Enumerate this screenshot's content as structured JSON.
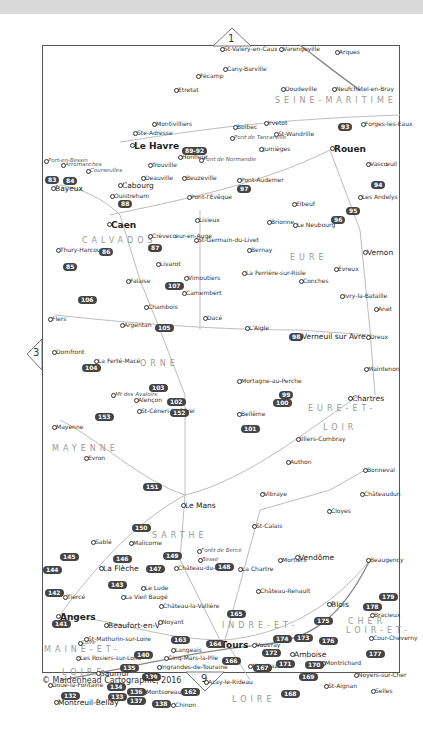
{
  "map": {
    "copyright": "© Maidenhead Cartographic, 2016",
    "page_markers": {
      "top": "1",
      "left": "3",
      "bottom": "9"
    },
    "regions": [
      {
        "label": "SEINE-MARITIME",
        "x": 275,
        "y": 96
      },
      {
        "label": "CALVADOS",
        "x": 82,
        "y": 236
      },
      {
        "label": "EURE",
        "x": 290,
        "y": 253
      },
      {
        "label": "ORNE",
        "x": 140,
        "y": 359
      },
      {
        "label": "EURE-ET-",
        "x": 308,
        "y": 404
      },
      {
        "label": "LOIR",
        "x": 323,
        "y": 423
      },
      {
        "label": "MAYENNE",
        "x": 52,
        "y": 444
      },
      {
        "label": "SARTHE",
        "x": 152,
        "y": 531
      },
      {
        "label": "LOIR-ET-",
        "x": 346,
        "y": 626
      },
      {
        "label": "CHER",
        "x": 348,
        "y": 617
      },
      {
        "label": "INDRE-ET-",
        "x": 222,
        "y": 621
      },
      {
        "label": "MAINE-ET-",
        "x": 44,
        "y": 645
      },
      {
        "label": "LOIRE",
        "x": 62,
        "y": 668
      },
      {
        "label": "LOIRE",
        "x": 232,
        "y": 695
      }
    ],
    "places": [
      {
        "name": "St-Valery-en-Caux",
        "x": 224,
        "y": 46,
        "cls": ""
      },
      {
        "name": "Varengeville",
        "x": 283,
        "y": 46,
        "cls": ""
      },
      {
        "name": "Arques",
        "x": 339,
        "y": 49,
        "cls": ""
      },
      {
        "name": "Cany-Barville",
        "x": 227,
        "y": 66,
        "cls": ""
      },
      {
        "name": "Fécamp",
        "x": 200,
        "y": 73,
        "cls": ""
      },
      {
        "name": "Etretat",
        "x": 178,
        "y": 87,
        "cls": ""
      },
      {
        "name": "Doudeville",
        "x": 285,
        "y": 86,
        "cls": ""
      },
      {
        "name": "Neufchâtel-en-Bray",
        "x": 336,
        "y": 86,
        "cls": ""
      },
      {
        "name": "Montivilliers",
        "x": 156,
        "y": 121,
        "cls": ""
      },
      {
        "name": "Ste-Adresse",
        "x": 137,
        "y": 130,
        "cls": ""
      },
      {
        "name": "Bolbec",
        "x": 237,
        "y": 124,
        "cls": ""
      },
      {
        "name": "Yvetot",
        "x": 268,
        "y": 120,
        "cls": ""
      },
      {
        "name": "Forges-les-Eaux",
        "x": 365,
        "y": 121,
        "cls": ""
      },
      {
        "name": "Le Havre",
        "x": 134,
        "y": 142,
        "cls": "big"
      },
      {
        "name": "Pont de Tancarville",
        "x": 234,
        "y": 135,
        "cls": "it"
      },
      {
        "name": "St-Wandrille",
        "x": 278,
        "y": 131,
        "cls": ""
      },
      {
        "name": "Honfleur",
        "x": 182,
        "y": 154,
        "cls": ""
      },
      {
        "name": "Pont de Normandie",
        "x": 203,
        "y": 157,
        "cls": "it"
      },
      {
        "name": "Jumièges",
        "x": 263,
        "y": 146,
        "cls": ""
      },
      {
        "name": "Rouen",
        "x": 334,
        "y": 145,
        "cls": "big"
      },
      {
        "name": "Vascœuil",
        "x": 370,
        "y": 161,
        "cls": ""
      },
      {
        "name": "Port-en-Bessin",
        "x": 48,
        "y": 158,
        "cls": "it"
      },
      {
        "name": "Arromanches",
        "x": 65,
        "y": 162,
        "cls": "it"
      },
      {
        "name": "Courseulles",
        "x": 90,
        "y": 168,
        "cls": "it"
      },
      {
        "name": "Trouville",
        "x": 152,
        "y": 162,
        "cls": ""
      },
      {
        "name": "Deauville",
        "x": 145,
        "y": 175,
        "cls": ""
      },
      {
        "name": "Beuzeville",
        "x": 186,
        "y": 175,
        "cls": ""
      },
      {
        "name": "Pont-Audemer",
        "x": 241,
        "y": 177,
        "cls": ""
      },
      {
        "name": "Cabourg",
        "x": 122,
        "y": 182,
        "cls": "mid"
      },
      {
        "name": "Bayeux",
        "x": 55,
        "y": 185,
        "cls": "mid"
      },
      {
        "name": "Ouistreham",
        "x": 114,
        "y": 193,
        "cls": ""
      },
      {
        "name": "Pont-l'Évêque",
        "x": 191,
        "y": 194,
        "cls": ""
      },
      {
        "name": "Elbeuf",
        "x": 296,
        "y": 201,
        "cls": ""
      },
      {
        "name": "Les Andelys",
        "x": 362,
        "y": 194,
        "cls": ""
      },
      {
        "name": "Caen",
        "x": 111,
        "y": 221,
        "cls": "big"
      },
      {
        "name": "Lisieux",
        "x": 199,
        "y": 217,
        "cls": ""
      },
      {
        "name": "Brionne",
        "x": 271,
        "y": 219,
        "cls": ""
      },
      {
        "name": "Le Neubourg",
        "x": 297,
        "y": 222,
        "cls": ""
      },
      {
        "name": "Crèvecœur-en-Auge",
        "x": 152,
        "y": 233,
        "cls": ""
      },
      {
        "name": "St-Germain-du-Livet",
        "x": 198,
        "y": 237,
        "cls": ""
      },
      {
        "name": "Bernay",
        "x": 251,
        "y": 247,
        "cls": ""
      },
      {
        "name": "Vernon",
        "x": 367,
        "y": 249,
        "cls": "mid"
      },
      {
        "name": "Thury-Harcourt",
        "x": 60,
        "y": 247,
        "cls": ""
      },
      {
        "name": "Livarot",
        "x": 160,
        "y": 261,
        "cls": ""
      },
      {
        "name": "Évreux",
        "x": 338,
        "y": 266,
        "cls": ""
      },
      {
        "name": "La Ferrière-sur-Risle",
        "x": 246,
        "y": 270,
        "cls": ""
      },
      {
        "name": "Conches",
        "x": 303,
        "y": 278,
        "cls": ""
      },
      {
        "name": "Falaise",
        "x": 130,
        "y": 278,
        "cls": ""
      },
      {
        "name": "Vimoutiers",
        "x": 188,
        "y": 275,
        "cls": ""
      },
      {
        "name": "Camembert",
        "x": 186,
        "y": 290,
        "cls": ""
      },
      {
        "name": "Ivry-la-Bataille",
        "x": 344,
        "y": 293,
        "cls": ""
      },
      {
        "name": "Anet",
        "x": 378,
        "y": 306,
        "cls": ""
      },
      {
        "name": "Chambois",
        "x": 148,
        "y": 304,
        "cls": ""
      },
      {
        "name": "Dacé",
        "x": 207,
        "y": 315,
        "cls": ""
      },
      {
        "name": "Flers",
        "x": 52,
        "y": 316,
        "cls": ""
      },
      {
        "name": "Argentan",
        "x": 124,
        "y": 322,
        "cls": ""
      },
      {
        "name": "L'Aigle",
        "x": 249,
        "y": 325,
        "cls": ""
      },
      {
        "name": "Verneuil sur Avre",
        "x": 302,
        "y": 333,
        "cls": "mid"
      },
      {
        "name": "Dreux",
        "x": 370,
        "y": 334,
        "cls": ""
      },
      {
        "name": "Domfront",
        "x": 56,
        "y": 349,
        "cls": ""
      },
      {
        "name": "La Ferté-Macé",
        "x": 98,
        "y": 358,
        "cls": ""
      },
      {
        "name": "Maintenon",
        "x": 368,
        "y": 366,
        "cls": ""
      },
      {
        "name": "Mortagne-au-Perche",
        "x": 241,
        "y": 378,
        "cls": ""
      },
      {
        "name": "Mt des Avaloirs",
        "x": 115,
        "y": 392,
        "cls": "it"
      },
      {
        "name": "Alençon",
        "x": 138,
        "y": 397,
        "cls": ""
      },
      {
        "name": "Chartres",
        "x": 352,
        "y": 395,
        "cls": "mid"
      },
      {
        "name": "St-Céneri-le-Gérei",
        "x": 141,
        "y": 408,
        "cls": ""
      },
      {
        "name": "Bellême",
        "x": 241,
        "y": 411,
        "cls": ""
      },
      {
        "name": "Mayenne",
        "x": 56,
        "y": 424,
        "cls": ""
      },
      {
        "name": "Illiers-Combray",
        "x": 300,
        "y": 436,
        "cls": ""
      },
      {
        "name": "Evron",
        "x": 88,
        "y": 455,
        "cls": ""
      },
      {
        "name": "Authon",
        "x": 290,
        "y": 459,
        "cls": ""
      },
      {
        "name": "Bonneval",
        "x": 367,
        "y": 467,
        "cls": ""
      },
      {
        "name": "Vibraye",
        "x": 264,
        "y": 491,
        "cls": ""
      },
      {
        "name": "Châteaudun",
        "x": 364,
        "y": 491,
        "cls": ""
      },
      {
        "name": "Le Mans",
        "x": 185,
        "y": 502,
        "cls": "mid"
      },
      {
        "name": "Cloyes",
        "x": 331,
        "y": 508,
        "cls": ""
      },
      {
        "name": "St-Calais",
        "x": 256,
        "y": 523,
        "cls": ""
      },
      {
        "name": "Sablé",
        "x": 95,
        "y": 539,
        "cls": ""
      },
      {
        "name": "Malicorne",
        "x": 133,
        "y": 540,
        "cls": ""
      },
      {
        "name": "Forêt de Bercé",
        "x": 201,
        "y": 548,
        "cls": "it"
      },
      {
        "name": "Bessé",
        "x": 202,
        "y": 557,
        "cls": "it"
      },
      {
        "name": "Mortiers",
        "x": 282,
        "y": 557,
        "cls": ""
      },
      {
        "name": "Vendôme",
        "x": 299,
        "y": 554,
        "cls": "mid"
      },
      {
        "name": "Beaugency",
        "x": 370,
        "y": 557,
        "cls": ""
      },
      {
        "name": "La Flèche",
        "x": 103,
        "y": 565,
        "cls": "mid"
      },
      {
        "name": "Château-du-Loir",
        "x": 178,
        "y": 565,
        "cls": ""
      },
      {
        "name": "La Chartre",
        "x": 242,
        "y": 566,
        "cls": ""
      },
      {
        "name": "Le Lude",
        "x": 145,
        "y": 585,
        "cls": ""
      },
      {
        "name": "Tiercé",
        "x": 67,
        "y": 594,
        "cls": ""
      },
      {
        "name": "La Vieil Baugé",
        "x": 125,
        "y": 594,
        "cls": ""
      },
      {
        "name": "Château-Renault",
        "x": 260,
        "y": 588,
        "cls": ""
      },
      {
        "name": "Château-la-Vallière",
        "x": 163,
        "y": 603,
        "cls": ""
      },
      {
        "name": "Blois",
        "x": 331,
        "y": 601,
        "cls": "mid"
      },
      {
        "name": "Bracieux",
        "x": 374,
        "y": 612,
        "cls": ""
      },
      {
        "name": "Angers",
        "x": 60,
        "y": 613,
        "cls": "big"
      },
      {
        "name": "Beaufort-en-V",
        "x": 108,
        "y": 622,
        "cls": "mid"
      },
      {
        "name": "Noyant",
        "x": 162,
        "y": 619,
        "cls": ""
      },
      {
        "name": "Cour-Cheverny",
        "x": 373,
        "y": 635,
        "cls": ""
      },
      {
        "name": "Tours",
        "x": 221,
        "y": 641,
        "cls": "big"
      },
      {
        "name": "Vouvray",
        "x": 256,
        "y": 642,
        "cls": ""
      },
      {
        "name": "Amboise",
        "x": 294,
        "y": 651,
        "cls": "mid"
      },
      {
        "name": "Montrichard",
        "x": 325,
        "y": 660,
        "cls": ""
      },
      {
        "name": "Noyers-sur-Cher",
        "x": 358,
        "y": 672,
        "cls": ""
      },
      {
        "name": "St-Mathurin-sur-Loire",
        "x": 88,
        "y": 636,
        "cls": ""
      },
      {
        "name": "Loire",
        "x": 82,
        "y": 640,
        "cls": "it"
      },
      {
        "name": "Cinq-Mars-la-Pile",
        "x": 168,
        "y": 655,
        "cls": ""
      },
      {
        "name": "Montbazon",
        "x": 252,
        "y": 663,
        "cls": ""
      },
      {
        "name": "Les Rosiers-sur-Loire",
        "x": 80,
        "y": 655,
        "cls": ""
      },
      {
        "name": "Langeais",
        "x": 175,
        "y": 647,
        "cls": ""
      },
      {
        "name": "Ingrandes-de-Touraine",
        "x": 161,
        "y": 664,
        "cls": ""
      },
      {
        "name": "Saumur",
        "x": 100,
        "y": 670,
        "cls": "mid"
      },
      {
        "name": "Azay-le-Rideau",
        "x": 208,
        "y": 679,
        "cls": ""
      },
      {
        "name": "St-Aignan",
        "x": 328,
        "y": 683,
        "cls": ""
      },
      {
        "name": "Selles",
        "x": 375,
        "y": 688,
        "cls": ""
      },
      {
        "name": "Doué-la-Fontaine",
        "x": 52,
        "y": 682,
        "cls": ""
      },
      {
        "name": "Montsoreau",
        "x": 146,
        "y": 689,
        "cls": ""
      },
      {
        "name": "Montreuil-Bellay",
        "x": 58,
        "y": 699,
        "cls": "mid"
      },
      {
        "name": "Chinon",
        "x": 175,
        "y": 702,
        "cls": ""
      }
    ],
    "badges": [
      {
        "n": "83",
        "x": 45,
        "y": 176
      },
      {
        "n": "84",
        "x": 63,
        "y": 177
      },
      {
        "n": "88",
        "x": 118,
        "y": 200
      },
      {
        "n": "89-92",
        "x": 182,
        "y": 147
      },
      {
        "n": "93",
        "x": 338,
        "y": 123
      },
      {
        "n": "94",
        "x": 371,
        "y": 181
      },
      {
        "n": "95",
        "x": 346,
        "y": 207
      },
      {
        "n": "96",
        "x": 331,
        "y": 216
      },
      {
        "n": "97",
        "x": 237,
        "y": 185
      },
      {
        "n": "85",
        "x": 63,
        "y": 263
      },
      {
        "n": "86",
        "x": 99,
        "y": 248
      },
      {
        "n": "87",
        "x": 148,
        "y": 244
      },
      {
        "n": "106",
        "x": 78,
        "y": 296
      },
      {
        "n": "107",
        "x": 165,
        "y": 282
      },
      {
        "n": "105",
        "x": 155,
        "y": 324
      },
      {
        "n": "98",
        "x": 289,
        "y": 333
      },
      {
        "n": "104",
        "x": 82,
        "y": 364
      },
      {
        "n": "103",
        "x": 149,
        "y": 384
      },
      {
        "n": "102",
        "x": 167,
        "y": 398
      },
      {
        "n": "152",
        "x": 170,
        "y": 409
      },
      {
        "n": "153",
        "x": 95,
        "y": 413
      },
      {
        "n": "99",
        "x": 279,
        "y": 391
      },
      {
        "n": "100",
        "x": 273,
        "y": 399
      },
      {
        "n": "101",
        "x": 241,
        "y": 425
      },
      {
        "n": "151",
        "x": 143,
        "y": 483
      },
      {
        "n": "150",
        "x": 132,
        "y": 524
      },
      {
        "n": "145",
        "x": 60,
        "y": 553
      },
      {
        "n": "144",
        "x": 43,
        "y": 566
      },
      {
        "n": "146",
        "x": 113,
        "y": 555
      },
      {
        "n": "147",
        "x": 146,
        "y": 565
      },
      {
        "n": "149",
        "x": 163,
        "y": 552
      },
      {
        "n": "148",
        "x": 215,
        "y": 563
      },
      {
        "n": "143",
        "x": 108,
        "y": 581
      },
      {
        "n": "142",
        "x": 45,
        "y": 589
      },
      {
        "n": "141",
        "x": 52,
        "y": 620
      },
      {
        "n": "165",
        "x": 227,
        "y": 610
      },
      {
        "n": "163",
        "x": 171,
        "y": 636
      },
      {
        "n": "164",
        "x": 206,
        "y": 640
      },
      {
        "n": "140",
        "x": 134,
        "y": 651
      },
      {
        "n": "135",
        "x": 120,
        "y": 664
      },
      {
        "n": "134",
        "x": 107,
        "y": 683
      },
      {
        "n": "139",
        "x": 142,
        "y": 673
      },
      {
        "n": "132",
        "x": 61,
        "y": 692
      },
      {
        "n": "133",
        "x": 108,
        "y": 693
      },
      {
        "n": "136",
        "x": 127,
        "y": 688
      },
      {
        "n": "137",
        "x": 127,
        "y": 697
      },
      {
        "n": "138",
        "x": 152,
        "y": 700
      },
      {
        "n": "162",
        "x": 181,
        "y": 688
      },
      {
        "n": "166",
        "x": 222,
        "y": 657
      },
      {
        "n": "167",
        "x": 253,
        "y": 664
      },
      {
        "n": "168",
        "x": 281,
        "y": 690
      },
      {
        "n": "169",
        "x": 299,
        "y": 673
      },
      {
        "n": "170",
        "x": 305,
        "y": 661
      },
      {
        "n": "171",
        "x": 276,
        "y": 660
      },
      {
        "n": "172",
        "x": 262,
        "y": 649
      },
      {
        "n": "173",
        "x": 294,
        "y": 634
      },
      {
        "n": "174",
        "x": 273,
        "y": 635
      },
      {
        "n": "175",
        "x": 314,
        "y": 617
      },
      {
        "n": "176",
        "x": 319,
        "y": 637
      },
      {
        "n": "177",
        "x": 366,
        "y": 650
      },
      {
        "n": "178",
        "x": 363,
        "y": 603
      },
      {
        "n": "179",
        "x": 379,
        "y": 593
      }
    ]
  }
}
